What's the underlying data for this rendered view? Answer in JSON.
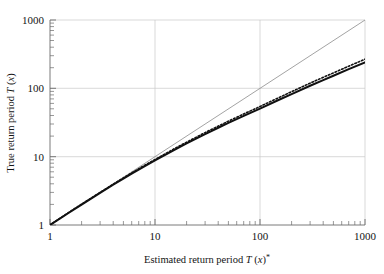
{
  "chart_data": {
    "type": "line",
    "title": "",
    "xlabel": "Estimated return period T (x)*",
    "ylabel": "True return period T (x)",
    "xscale": "log",
    "yscale": "log",
    "xlim": [
      1,
      1000
    ],
    "ylim": [
      1,
      1000
    ],
    "xticks": [
      1,
      10,
      100,
      1000
    ],
    "xticklabels": [
      "1",
      "10",
      "100",
      "1000"
    ],
    "yticks": [
      1,
      10,
      100,
      1000
    ],
    "yticklabels": [
      "1",
      "10",
      "100",
      "1000"
    ],
    "grid": true,
    "legend": "none",
    "series": [
      {
        "name": "identity-reference-line",
        "style": "thin-solid-gray",
        "color": "#8c8c8c",
        "x": [
          1,
          1000
        ],
        "y": [
          1,
          1000
        ]
      },
      {
        "name": "true-return-period-solid",
        "style": "thick-solid-black",
        "color": "#111111",
        "x": [
          1,
          1.5,
          2,
          3,
          4,
          5,
          6,
          8,
          10,
          15,
          20,
          30,
          40,
          50,
          70,
          100,
          150,
          200,
          300,
          400,
          500,
          700,
          1000
        ],
        "y": [
          1,
          1.5,
          1.99,
          2.95,
          3.88,
          4.78,
          5.65,
          7.3,
          8.85,
          12.4,
          15.6,
          21.4,
          26.5,
          31.2,
          39.6,
          50.5,
          67.5,
          82.5,
          109,
          132,
          153,
          191,
          240
        ]
      },
      {
        "name": "true-return-period-dotted",
        "style": "dotted-black",
        "color": "#111111",
        "x": [
          1,
          1.5,
          2,
          3,
          4,
          5,
          6,
          8,
          10,
          15,
          20,
          30,
          40,
          50,
          70,
          100,
          150,
          200,
          300,
          400,
          500,
          700,
          1000
        ],
        "y": [
          1,
          1.52,
          2.02,
          3.0,
          3.96,
          4.89,
          5.79,
          7.5,
          9.1,
          12.9,
          16.3,
          22.5,
          28.0,
          33.1,
          42.2,
          54.2,
          72.8,
          89.3,
          119,
          145,
          168,
          211,
          267
        ]
      }
    ]
  },
  "axis": {
    "x_label_plain_1": "Estimated return period ",
    "x_label_italic": "T",
    "x_label_plain_2": " (",
    "x_label_italic_x": "x",
    "x_label_plain_3": ")",
    "x_label_star": "*",
    "y_label_plain_1": "True return period ",
    "y_label_italic": "T",
    "y_label_plain_2": " (",
    "y_label_italic_x": "x",
    "y_label_plain_3": ")"
  },
  "ticks": {
    "x": [
      "1",
      "10",
      "100",
      "1000"
    ],
    "y": [
      "1",
      "10",
      "100",
      "1000"
    ]
  },
  "colors": {
    "grid": "#c9c9c9",
    "axis": "#6b6b6b",
    "reference_line": "#8c8c8c",
    "data_line": "#111111",
    "background": "#ffffff"
  }
}
